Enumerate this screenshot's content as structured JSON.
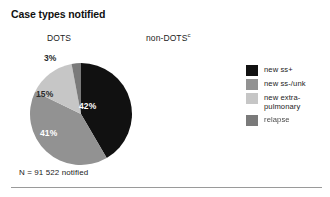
{
  "figure": {
    "title": "Case types notified",
    "caption": "N = 91 522 notified",
    "columns": [
      {
        "label": "DOTS",
        "superscript": ""
      },
      {
        "label": "non-DOTS",
        "superscript": "c"
      }
    ]
  },
  "legend": {
    "position": "right",
    "items": [
      {
        "label": "new ss+",
        "color": "#111111"
      },
      {
        "label": "new ss-/unk",
        "color": "#929292"
      },
      {
        "label": "new extra-\npulmonary",
        "color": "#c6c6c6"
      },
      {
        "label": "relapse",
        "color": "#7a7a7a"
      }
    ]
  },
  "colors": {
    "new_ss_plus": "#111111",
    "new_ss_minus_unk": "#929292",
    "new_extra_pulmonary": "#c6c6c6",
    "relapse": "#7a7a7a",
    "background": "#ffffff",
    "divider": "#9a9a9a"
  },
  "chart_data": {
    "type": "pie",
    "title": "Case types notified",
    "subtitle": "DOTS",
    "total_label": "N = 91 522 notified",
    "total": 91522,
    "categories": [
      "new ss+",
      "new ss-/unk",
      "new extra-pulmonary",
      "relapse"
    ],
    "values": [
      42,
      41,
      15,
      3
    ],
    "value_labels": [
      "42%",
      "41%",
      "15%",
      "3%"
    ],
    "unit": "percent",
    "colors": [
      "#111111",
      "#929292",
      "#c6c6c6",
      "#7a7a7a"
    ],
    "start_angle_deg": 0,
    "direction": "clockwise",
    "legend_position": "right",
    "grid": false
  },
  "slice_labels": {
    "ss_plus": "42%",
    "ss_minus_unk": "41%",
    "extra_pulmonary": "15%",
    "relapse": "3%"
  }
}
